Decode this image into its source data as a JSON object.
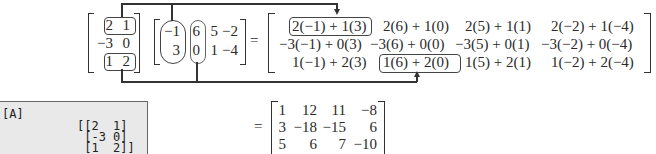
{
  "matrix_A": {
    "rows": [
      [
        "2",
        "1"
      ],
      [
        "−3",
        "0"
      ],
      [
        "1",
        "2"
      ]
    ]
  },
  "matrix_B": {
    "rows": [
      [
        "−1",
        "6",
        "5",
        "−2"
      ],
      [
        "3",
        "0",
        "1",
        "−4"
      ]
    ]
  },
  "equals": "=",
  "expanded_product": {
    "rows": [
      [
        "2(−1) + 1(3)",
        "2(6) + 1(0)",
        "2(5) + 1(1)",
        "2(−2) + 1(−4)"
      ],
      [
        "−3(−1) + 0(3)",
        "−3(6) + 0(0)",
        "−3(5) + 0(1)",
        "−3(−2) + 0(−4)"
      ],
      [
        "1(−1) + 2(3)",
        "1(6) + 2(0)",
        "1(5) + 2(1)",
        "1(−2) + 2(−4)"
      ]
    ]
  },
  "result": {
    "rows": [
      [
        "1",
        "12",
        "11",
        "−8"
      ],
      [
        "3",
        "−18",
        "−15",
        "6"
      ],
      [
        "5",
        "6",
        "7",
        "−10"
      ]
    ]
  },
  "calculator": {
    "label": "[A]",
    "lines": [
      "[[2  1]",
      " [-3 0]",
      " [1  2]]"
    ]
  }
}
